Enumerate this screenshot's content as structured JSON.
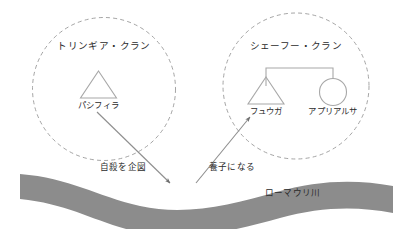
{
  "diagram": {
    "type": "kinship-clan-diagram",
    "background_color": "#ffffff",
    "line_color": "#a8a8a8",
    "text_color": "#2b2b2b",
    "river_color": "#8c8c8c",
    "clans": [
      {
        "id": "trinngia",
        "title": "トリンギア・クラン",
        "members": [
          {
            "id": "pashifira",
            "name": "パシフィラ",
            "symbol": "triangle"
          }
        ]
      },
      {
        "id": "shefu",
        "title": "シェーフー・クラン",
        "members": [
          {
            "id": "fuuga",
            "name": "フュウガ",
            "symbol": "triangle"
          },
          {
            "id": "apuriarusa",
            "name": "アプリアルサ",
            "symbol": "circle"
          }
        ]
      }
    ],
    "relations": [
      {
        "id": "suicide-attempt",
        "label": "自殺を企図",
        "from": "pashifira",
        "to": "river",
        "arrow": "down-right"
      },
      {
        "id": "adoption",
        "label": "養子になる",
        "from": "river",
        "to": "fuuga",
        "arrow": "up-right"
      }
    ],
    "river": {
      "id": "roumauri-river",
      "label": "ローマウリ川"
    }
  }
}
